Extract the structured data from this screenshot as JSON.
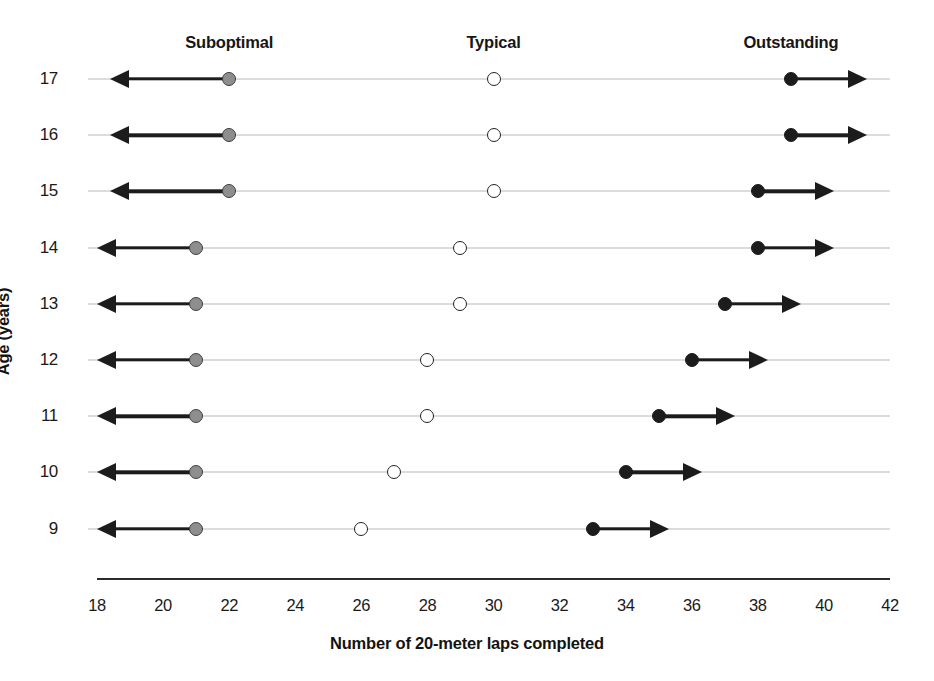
{
  "chart_data": {
    "type": "scatter",
    "title": "",
    "xlabel": "Number of 20-meter laps completed",
    "ylabel": "Age (years)",
    "xlim": [
      18,
      42
    ],
    "xticks": [
      18,
      20,
      22,
      24,
      26,
      28,
      30,
      32,
      34,
      36,
      38,
      40,
      42
    ],
    "grid": false,
    "zone_labels": [
      {
        "text": "Suboptimal",
        "x": 22
      },
      {
        "text": "Typical",
        "x": 30
      },
      {
        "text": "Outstanding",
        "x": 39
      }
    ],
    "categories": [
      17,
      16,
      15,
      14,
      13,
      12,
      11,
      10,
      9
    ],
    "series": [
      {
        "name": "Suboptimal",
        "marker": "gray-filled-circle",
        "color": "#8e8e8e",
        "arrow": "left",
        "values": [
          22,
          22,
          22,
          21,
          21,
          21,
          21,
          21,
          21
        ]
      },
      {
        "name": "Typical",
        "marker": "open-circle",
        "color": "#ffffff",
        "arrow": "none",
        "values": [
          30,
          30,
          30,
          29,
          29,
          28,
          28,
          27,
          26
        ]
      },
      {
        "name": "Outstanding",
        "marker": "black-filled-circle",
        "color": "#1c1c1c",
        "arrow": "right",
        "values": [
          39,
          39,
          38,
          38,
          37,
          36,
          35,
          34,
          33
        ]
      }
    ],
    "rows": [
      {
        "age": "17",
        "suboptimal": 22,
        "typical": 30,
        "outstanding": 39,
        "left_arrow_tip": 18.4,
        "right_arrow_tip": 41.3
      },
      {
        "age": "16",
        "suboptimal": 22,
        "typical": 30,
        "outstanding": 39,
        "left_arrow_tip": 18.4,
        "right_arrow_tip": 41.3
      },
      {
        "age": "15",
        "suboptimal": 22,
        "typical": 30,
        "outstanding": 38,
        "left_arrow_tip": 18.4,
        "right_arrow_tip": 40.3
      },
      {
        "age": "14",
        "suboptimal": 21,
        "typical": 29,
        "outstanding": 38,
        "left_arrow_tip": 18.0,
        "right_arrow_tip": 40.3
      },
      {
        "age": "13",
        "suboptimal": 21,
        "typical": 29,
        "outstanding": 37,
        "left_arrow_tip": 18.0,
        "right_arrow_tip": 39.3
      },
      {
        "age": "12",
        "suboptimal": 21,
        "typical": 28,
        "outstanding": 36,
        "left_arrow_tip": 18.0,
        "right_arrow_tip": 38.3
      },
      {
        "age": "11",
        "suboptimal": 21,
        "typical": 28,
        "outstanding": 35,
        "left_arrow_tip": 18.0,
        "right_arrow_tip": 37.3
      },
      {
        "age": "10",
        "suboptimal": 21,
        "typical": 27,
        "outstanding": 34,
        "left_arrow_tip": 18.0,
        "right_arrow_tip": 36.3
      },
      {
        "age": "9",
        "suboptimal": 21,
        "typical": 26,
        "outstanding": 33,
        "left_arrow_tip": 18.0,
        "right_arrow_tip": 35.3
      }
    ]
  }
}
